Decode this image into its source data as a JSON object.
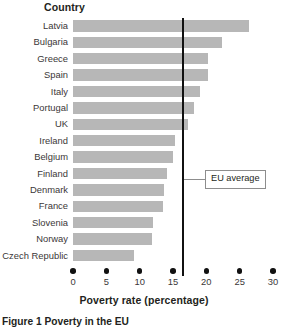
{
  "figure": {
    "caption": "Figure 1  Poverty in the EU",
    "y_axis_header": "Country",
    "x_axis_title": "Poverty rate (percentage)",
    "annotation_label": "EU average"
  },
  "chart_data": {
    "type": "bar",
    "orientation": "horizontal",
    "title": "Figure 1  Poverty in the EU",
    "xlabel": "Poverty rate (percentage)",
    "ylabel": "Country",
    "xlim": [
      0,
      30
    ],
    "xticks": [
      0,
      5,
      10,
      15,
      20,
      25,
      30
    ],
    "xtick_labels": [
      "0",
      "5",
      "10",
      "15",
      "20",
      "25",
      "30"
    ],
    "grid": false,
    "legend": null,
    "bar_color": "#b7b7b7",
    "categories": [
      "Latvia",
      "Bulgaria",
      "Greece",
      "Spain",
      "Italy",
      "Portugal",
      "UK",
      "Ireland",
      "Belgium",
      "Finland",
      "Denmark",
      "France",
      "Slovenia",
      "Norway",
      "Czech Republic"
    ],
    "values": [
      26.4,
      22.4,
      20.3,
      20.2,
      19.1,
      18.1,
      17.3,
      15.3,
      15.0,
      14.1,
      13.7,
      13.5,
      12.0,
      11.9,
      9.1
    ],
    "annotations": [
      {
        "label": "EU average",
        "type": "vertical-line",
        "value": 16.5,
        "line_color": "#111111"
      }
    ]
  }
}
